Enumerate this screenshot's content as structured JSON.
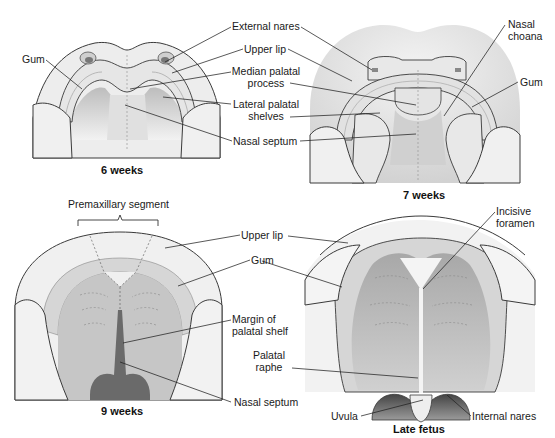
{
  "panels": {
    "week6": {
      "caption": "6 weeks",
      "labels": {
        "gum": "Gum",
        "external_nares": "External nares",
        "upper_lip": "Upper lip",
        "median_palatal_1": "Median palatal",
        "median_palatal_2": "process",
        "lateral_palatal_1": "Lateral palatal",
        "lateral_palatal_2": "shelves",
        "nasal_septum": "Nasal septum"
      }
    },
    "week7": {
      "caption": "7 weeks",
      "labels": {
        "nasal_choana_1": "Nasal",
        "nasal_choana_2": "choana",
        "gum": "Gum"
      }
    },
    "week9": {
      "caption": "9 weeks",
      "labels": {
        "premaxillary_segment": "Premaxillary segment",
        "upper_lip": "Upper lip",
        "gum": "Gum",
        "margin_1": "Margin of",
        "margin_2": "palatal shelf",
        "palatal_raphe_1": "Palatal",
        "palatal_raphe_2": "raphe",
        "nasal_septum": "Nasal septum"
      }
    },
    "late_fetus": {
      "caption": "Late fetus",
      "labels": {
        "incisive_1": "Incisive",
        "incisive_2": "foramen",
        "uvula": "Uvula",
        "internal_nares": "Internal nares"
      }
    }
  },
  "colors": {
    "outline": "#3a3a3a",
    "skin_light": "#ececec",
    "skin_mid": "#d6d6d6",
    "gum": "#dcdcdc",
    "palate_dark": "#b4b4b4",
    "septum_dark": "#6a6a6a",
    "leader": "#222222"
  }
}
